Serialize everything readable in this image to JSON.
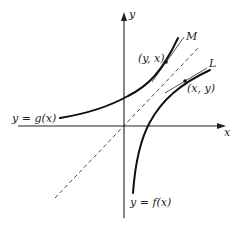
{
  "diagram": {
    "axes": {
      "x_label": "x",
      "y_label": "y"
    },
    "curves": {
      "g": {
        "label": "y = g(x)"
      },
      "f": {
        "label": "y = f(x)"
      }
    },
    "points": {
      "on_g": {
        "label": "(y, x)"
      },
      "on_f": {
        "label": "(x, y)"
      }
    },
    "tangent_lines": {
      "M": {
        "label": "M"
      },
      "L": {
        "label": "L"
      }
    },
    "reflection_line": {
      "label": "y = x",
      "style": "dashed"
    },
    "colors": {
      "ink": "#111111",
      "background": "#ffffff"
    }
  }
}
